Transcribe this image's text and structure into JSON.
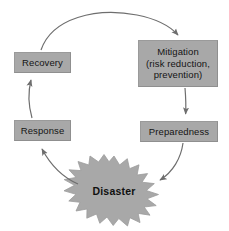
{
  "diagram": {
    "type": "cycle-diagram",
    "colors": {
      "box_fill": "#a8a8a8",
      "box_border": "#9a9a9a",
      "star_fill": "#a8a8a8",
      "star_border": "#9a9a9a",
      "arrow": "#6e6e6e",
      "text": "#141414",
      "background": "#ffffff"
    },
    "nodes": [
      {
        "id": "recovery",
        "label": "Recovery",
        "shape": "rectangle"
      },
      {
        "id": "mitigation",
        "label": "Mitigation\n(risk reduction,\nprevention)",
        "shape": "rectangle"
      },
      {
        "id": "preparedness",
        "label": "Preparedness",
        "shape": "rectangle"
      },
      {
        "id": "response",
        "label": "Response",
        "shape": "rectangle"
      },
      {
        "id": "disaster",
        "label": "Disaster",
        "shape": "starburst"
      }
    ],
    "edges": [
      {
        "id": "recovery-to-mitigation",
        "from": "Recovery",
        "to": "Mitigation",
        "style": "curved-arrow"
      },
      {
        "id": "mitigation-to-preparedness",
        "from": "Mitigation",
        "to": "Preparedness",
        "style": "straight-arrow"
      },
      {
        "id": "preparedness-to-disaster",
        "from": "Preparedness",
        "to": "Disaster",
        "style": "curved-arrow"
      },
      {
        "id": "disaster-to-response",
        "from": "Disaster",
        "to": "Response",
        "style": "curved-arrow"
      },
      {
        "id": "response-to-recovery",
        "from": "Response",
        "to": "Recovery",
        "style": "curved-arrow"
      }
    ]
  }
}
